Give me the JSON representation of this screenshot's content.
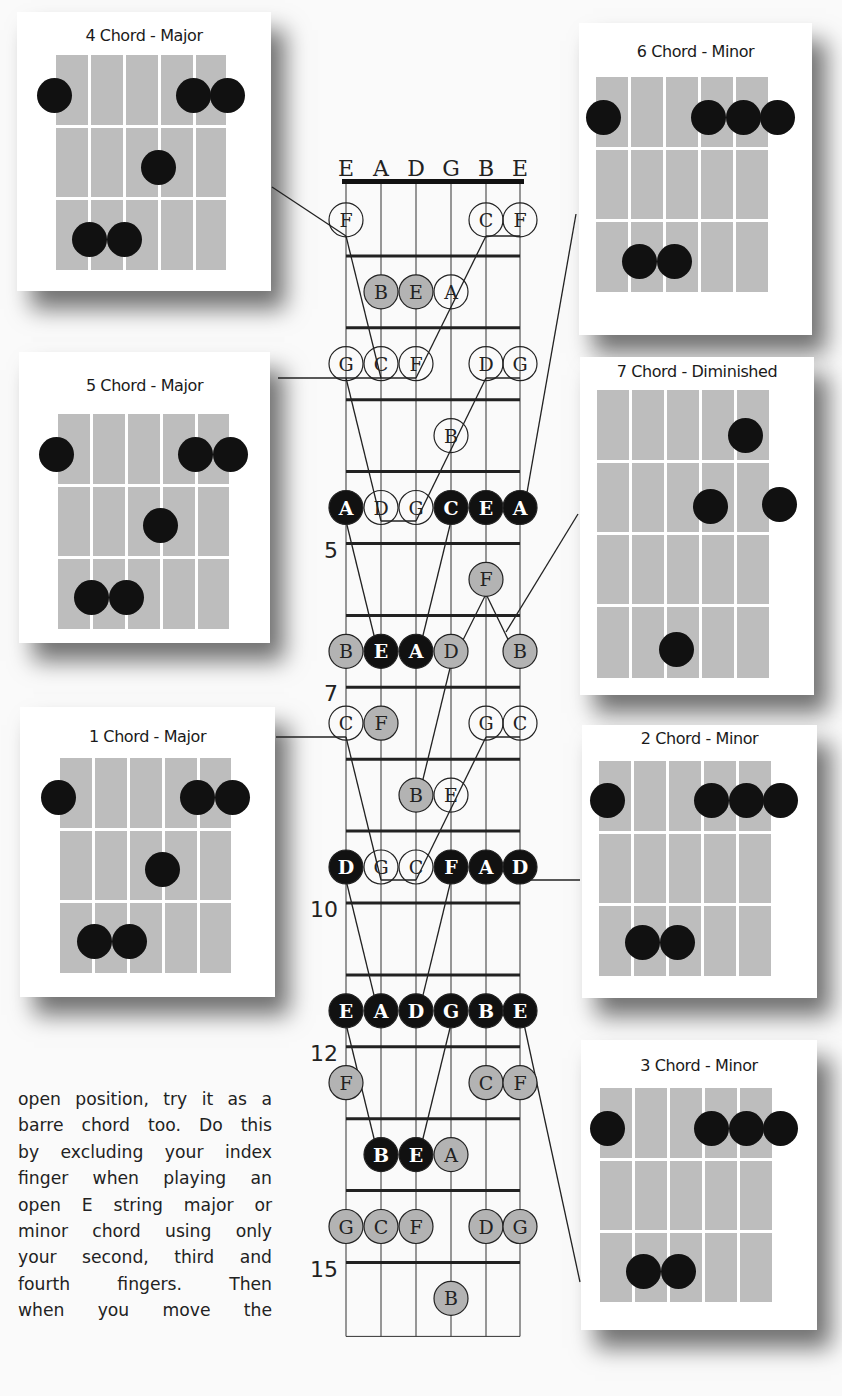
{
  "fretboard": {
    "strings": [
      "E",
      "A",
      "D",
      "G",
      "B",
      "E"
    ],
    "fret_markers": [
      {
        "label": "5",
        "fret": 5
      },
      {
        "label": "7",
        "fret": 7
      },
      {
        "label": "10",
        "fret": 10
      },
      {
        "label": "12",
        "fret": 12
      },
      {
        "label": "15",
        "fret": 15
      }
    ],
    "notes": [
      {
        "fret": 1,
        "string": 0,
        "note": "F",
        "style": "white"
      },
      {
        "fret": 1,
        "string": 4,
        "note": "C",
        "style": "white"
      },
      {
        "fret": 1,
        "string": 5,
        "note": "F",
        "style": "white"
      },
      {
        "fret": 2,
        "string": 1,
        "note": "B",
        "style": "gray"
      },
      {
        "fret": 2,
        "string": 2,
        "note": "E",
        "style": "gray"
      },
      {
        "fret": 2,
        "string": 3,
        "note": "A",
        "style": "white"
      },
      {
        "fret": 3,
        "string": 0,
        "note": "G",
        "style": "white"
      },
      {
        "fret": 3,
        "string": 1,
        "note": "C",
        "style": "white"
      },
      {
        "fret": 3,
        "string": 2,
        "note": "F",
        "style": "white"
      },
      {
        "fret": 3,
        "string": 4,
        "note": "D",
        "style": "white"
      },
      {
        "fret": 3,
        "string": 5,
        "note": "G",
        "style": "white"
      },
      {
        "fret": 4,
        "string": 3,
        "note": "B",
        "style": "white"
      },
      {
        "fret": 5,
        "string": 0,
        "note": "A",
        "style": "black"
      },
      {
        "fret": 5,
        "string": 1,
        "note": "D",
        "style": "white"
      },
      {
        "fret": 5,
        "string": 2,
        "note": "G",
        "style": "white"
      },
      {
        "fret": 5,
        "string": 3,
        "note": "C",
        "style": "black"
      },
      {
        "fret": 5,
        "string": 4,
        "note": "E",
        "style": "black"
      },
      {
        "fret": 5,
        "string": 5,
        "note": "A",
        "style": "black"
      },
      {
        "fret": 6,
        "string": 4,
        "note": "F",
        "style": "gray"
      },
      {
        "fret": 7,
        "string": 0,
        "note": "B",
        "style": "gray"
      },
      {
        "fret": 7,
        "string": 1,
        "note": "E",
        "style": "black"
      },
      {
        "fret": 7,
        "string": 2,
        "note": "A",
        "style": "black"
      },
      {
        "fret": 7,
        "string": 3,
        "note": "D",
        "style": "gray"
      },
      {
        "fret": 7,
        "string": 5,
        "note": "B",
        "style": "gray"
      },
      {
        "fret": 8,
        "string": 0,
        "note": "C",
        "style": "white"
      },
      {
        "fret": 8,
        "string": 1,
        "note": "F",
        "style": "gray"
      },
      {
        "fret": 8,
        "string": 4,
        "note": "G",
        "style": "white"
      },
      {
        "fret": 8,
        "string": 5,
        "note": "C",
        "style": "white"
      },
      {
        "fret": 9,
        "string": 2,
        "note": "B",
        "style": "gray"
      },
      {
        "fret": 9,
        "string": 3,
        "note": "E",
        "style": "white"
      },
      {
        "fret": 10,
        "string": 0,
        "note": "D",
        "style": "black"
      },
      {
        "fret": 10,
        "string": 1,
        "note": "G",
        "style": "white"
      },
      {
        "fret": 10,
        "string": 2,
        "note": "C",
        "style": "white"
      },
      {
        "fret": 10,
        "string": 3,
        "note": "F",
        "style": "black"
      },
      {
        "fret": 10,
        "string": 4,
        "note": "A",
        "style": "black"
      },
      {
        "fret": 10,
        "string": 5,
        "note": "D",
        "style": "black"
      },
      {
        "fret": 12,
        "string": 0,
        "note": "E",
        "style": "black"
      },
      {
        "fret": 12,
        "string": 1,
        "note": "A",
        "style": "black"
      },
      {
        "fret": 12,
        "string": 2,
        "note": "D",
        "style": "black"
      },
      {
        "fret": 12,
        "string": 3,
        "note": "G",
        "style": "black"
      },
      {
        "fret": 12,
        "string": 4,
        "note": "B",
        "style": "black"
      },
      {
        "fret": 12,
        "string": 5,
        "note": "E",
        "style": "black"
      },
      {
        "fret": 13,
        "string": 0,
        "note": "F",
        "style": "gray"
      },
      {
        "fret": 13,
        "string": 4,
        "note": "C",
        "style": "gray"
      },
      {
        "fret": 13,
        "string": 5,
        "note": "F",
        "style": "gray"
      },
      {
        "fret": 14,
        "string": 1,
        "note": "B",
        "style": "black"
      },
      {
        "fret": 14,
        "string": 2,
        "note": "E",
        "style": "black"
      },
      {
        "fret": 14,
        "string": 3,
        "note": "A",
        "style": "gray"
      },
      {
        "fret": 15,
        "string": 0,
        "note": "G",
        "style": "gray"
      },
      {
        "fret": 15,
        "string": 1,
        "note": "C",
        "style": "gray"
      },
      {
        "fret": 15,
        "string": 2,
        "note": "F",
        "style": "gray"
      },
      {
        "fret": 15,
        "string": 4,
        "note": "D",
        "style": "gray"
      },
      {
        "fret": 15,
        "string": 5,
        "note": "G",
        "style": "gray"
      },
      {
        "fret": 16,
        "string": 3,
        "note": "B",
        "style": "gray"
      }
    ]
  },
  "chord_cards": [
    {
      "id": "four",
      "title": "4 Chord - Major",
      "side": "left"
    },
    {
      "id": "five",
      "title": "5 Chord - Major",
      "side": "left"
    },
    {
      "id": "one",
      "title": "1 Chord - Major",
      "side": "left"
    },
    {
      "id": "six",
      "title": "6 Chord - Minor",
      "side": "right"
    },
    {
      "id": "seven",
      "title": "7 Chord - Diminished",
      "side": "right"
    },
    {
      "id": "two",
      "title": "2 Chord - Minor",
      "side": "right"
    },
    {
      "id": "three",
      "title": "3 Chord - Minor",
      "side": "right"
    }
  ],
  "body_text": {
    "lines": [
      "open position, try it as a",
      "barre chord too. Do this",
      "by excluding your index",
      "finger when playing an",
      "open E string major or",
      "minor chord using only",
      "your second, third and",
      "fourth fingers. Then",
      "when you move the"
    ]
  },
  "colors": {
    "black_note": "#111111",
    "gray_note": "#b3b3b3",
    "white_note": "#ffffff",
    "chord_grid": "#bdbdbd"
  }
}
